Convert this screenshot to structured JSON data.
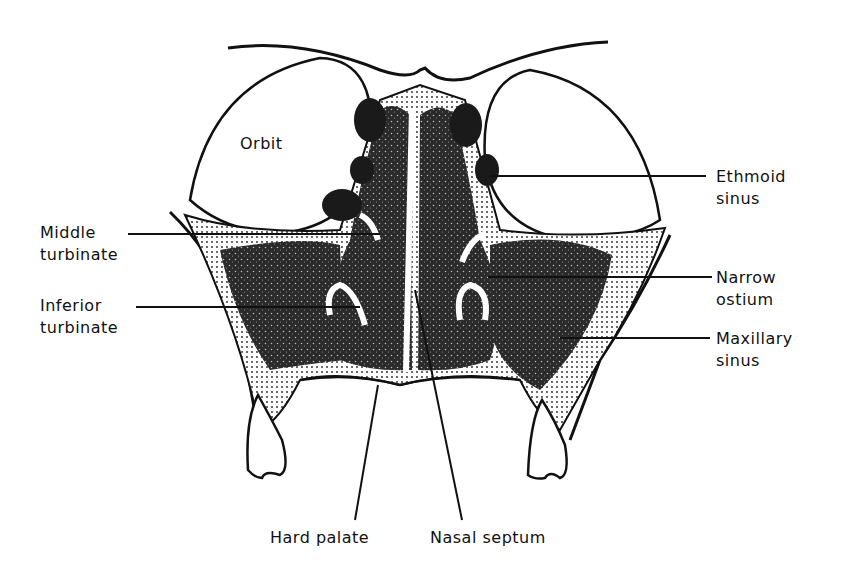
{
  "diagram": {
    "labels": {
      "orbit": "Orbit",
      "ethmoid_1": "Ethmoid",
      "ethmoid_2": "sinus",
      "middle_1": "Middle",
      "middle_2": "turbinate",
      "inferior_1": "Inferior",
      "inferior_2": "turbinate",
      "narrow_1": "Narrow",
      "narrow_2": "ostium",
      "maxillary_1": "Maxillary",
      "maxillary_2": "sinus",
      "hard_palate": "Hard palate",
      "nasal_septum": "Nasal septum"
    },
    "colors": {
      "ink": "#111111",
      "background": "#ffffff"
    }
  }
}
